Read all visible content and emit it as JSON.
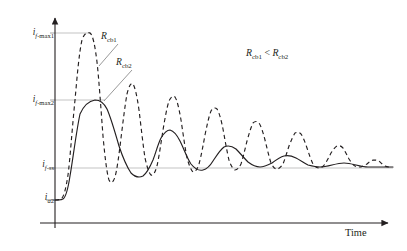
{
  "figure": {
    "background_color": "#ffffff",
    "ink_color": "#231f20",
    "gridline_color": "#bcbcbc"
  },
  "axes": {
    "x_axis_label": "Time",
    "x_axis_has_arrow": true,
    "y_axis_has_arrow": true,
    "y_tick_labels": [
      {
        "id": "if-max1",
        "text_html": "<span class=\"it\">i</span><sub><span class=\"subit\">f</span>-max1</sub>",
        "plain": "i_f-max1"
      },
      {
        "id": "if-max2",
        "text_html": "<span class=\"it\">i</span><sub><span class=\"subit\">f</span>-max2</sub>",
        "plain": "i_f-max2"
      },
      {
        "id": "if-ss",
        "text_html": "<span class=\"it\">i</span><sub><span class=\"subit\">f</span>-ss</sub>",
        "plain": "i_f-ss"
      },
      {
        "id": "ia2",
        "text_html": "<span class=\"it\">i</span><sub><span class=\"subit\">a</span>2</sub>",
        "plain": "i_a2"
      }
    ]
  },
  "annotations": {
    "curve1_label_html": "<span class=\"it\">R</span><sub>cb1</sub>",
    "curve1_label_plain": "R_cb1",
    "curve2_label_html": "<span class=\"it\">R</span><sub>cb2</sub>",
    "curve2_label_plain": "R_cb2",
    "inequality_html": "<span class=\"it\">R</span><sub>cb1</sub> &lt; <span class=\"it\">R</span><sub>cb2</sub>",
    "inequality_plain": "R_cb1 < R_cb2"
  },
  "chart_data": {
    "type": "line",
    "title": "",
    "xlabel": "Time",
    "ylabel": "",
    "grid": true,
    "legend_position": "inline-annotation",
    "x_axis": {
      "ticks": [],
      "range_label": "Time",
      "arrow": true
    },
    "y_axis": {
      "tick_labels": [
        "i_f-max1",
        "i_f-max2",
        "i_f-ss",
        "i_a2"
      ],
      "tick_values": [
        1.0,
        0.62,
        0.3,
        0.1
      ],
      "arrow": true,
      "ticks_numeric": false
    },
    "gridlines": [
      {
        "label": "i_f-max1",
        "value": 1.0,
        "extent": "to-first-dashed-peak"
      },
      {
        "label": "i_f-max2",
        "value": 0.62,
        "extent": "to-first-solid-peak"
      },
      {
        "label": "i_f-ss",
        "value": 0.3,
        "extent": "full-width"
      },
      {
        "label": "i_a2",
        "value": 0.1,
        "extent": "to-curve-start"
      }
    ],
    "series": [
      {
        "name": "R_cb1",
        "style": "dashed",
        "color": "#231f20",
        "description": "Underdamped fault-current response for the smaller circuit-breaker resistance: large first overshoot reaching i_f-max1, high oscillation frequency, slow decay toward i_f-ss.",
        "initial_value": 0.1,
        "steady_state": 0.3,
        "first_peak_value": 1.0,
        "peak_values": [
          1.0,
          0.695,
          0.635,
          0.575,
          0.525,
          0.465,
          0.425,
          0.37,
          0.335
        ],
        "trough_values": [
          0.075,
          0.13,
          0.165,
          0.2,
          0.225,
          0.25,
          0.265,
          0.28,
          0.29
        ],
        "oscillation_count": 9,
        "damping": "light"
      },
      {
        "name": "R_cb2",
        "style": "solid",
        "color": "#231f20",
        "description": "More heavily damped fault-current response for the larger circuit-breaker resistance: first overshoot only reaches i_f-max2, lower oscillation frequency, faster decay toward i_f-ss.",
        "initial_value": 0.1,
        "steady_state": 0.3,
        "first_peak_value": 0.62,
        "peak_values": [
          0.62,
          0.44,
          0.365,
          0.325,
          0.31
        ],
        "trough_values": [
          0.255,
          0.285,
          0.295,
          0.3
        ],
        "oscillation_count": 5,
        "damping": "moderate"
      }
    ],
    "annotations": [
      {
        "text": "R_cb1",
        "points_to": "dashed-curve",
        "leader_line": true
      },
      {
        "text": "R_cb2",
        "points_to": "solid-curve",
        "leader_line": true
      },
      {
        "text": "R_cb1 < R_cb2",
        "position": "upper-right",
        "leader_line": false
      }
    ]
  }
}
